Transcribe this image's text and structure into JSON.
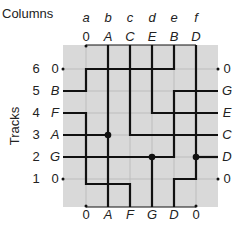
{
  "titles": {
    "columns": "Columns",
    "tracks": "Tracks"
  },
  "columns": [
    "a",
    "b",
    "c",
    "d",
    "e",
    "f"
  ],
  "tracks": [
    "6",
    "5",
    "4",
    "3",
    "2",
    "1"
  ],
  "top_terminals": [
    "0",
    "A",
    "C",
    "E",
    "B",
    "D"
  ],
  "bottom_terminals": [
    "0",
    "A",
    "F",
    "G",
    "D",
    "0"
  ],
  "left_terminals": [
    "0",
    "B",
    "F",
    "A",
    "G",
    "0"
  ],
  "right_terminals": [
    "0",
    "G",
    "E",
    "C",
    "D",
    "0"
  ],
  "colors": {
    "grid_bg": "#d9d9d9",
    "grid_line": "#bdbdbd",
    "wire": "#111111",
    "text": "#222222"
  },
  "nets": [
    {
      "name": "A",
      "path": "top b -> bottom b; track 3 left -> col b (via)"
    },
    {
      "name": "B",
      "path": "top e -> track 6 -> col a -> track 5 -> left"
    },
    {
      "name": "C",
      "path": "top c -> track 3 -> right"
    },
    {
      "name": "D",
      "path": "top f -> track 1 -> col e -> bottom; track 2 right -> col f (via)"
    },
    {
      "name": "E",
      "path": "top d -> track 4 -> right"
    },
    {
      "name": "F",
      "path": "left track 4 -> col a -> below track 1 -> col c -> bottom"
    },
    {
      "name": "G",
      "path": "left track 2 -> col e -> track 5 -> right; col d bottom (via)"
    }
  ]
}
